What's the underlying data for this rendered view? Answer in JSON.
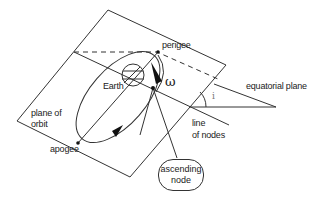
{
  "diagram": {
    "labels": {
      "perigee": "perigee",
      "earth": "Earth",
      "omega": "ω",
      "equatorial_plane": "equatorial plane",
      "inclination": "i",
      "plane_of_orbit_line1": "plane of",
      "plane_of_orbit_line2": "orbit",
      "line_of_nodes_line1": "line",
      "line_of_nodes_line2": "of nodes",
      "apogee": "apogee",
      "ascending_node_line1": "ascending",
      "ascending_node_line2": "node"
    },
    "colors": {
      "stroke": "#333333",
      "text": "#222222",
      "inclination_label": "#777777",
      "background": "#ffffff"
    }
  }
}
